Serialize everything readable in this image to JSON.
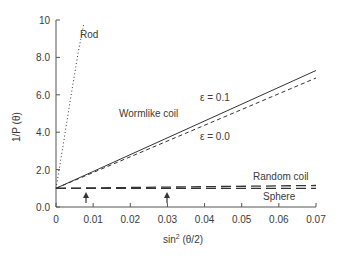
{
  "chart_data": {
    "type": "line",
    "title": "",
    "xlabel": "sin² (θ/2)",
    "ylabel": "1/P (θ)",
    "xlim": [
      0,
      0.07
    ],
    "ylim": [
      0,
      10
    ],
    "x_ticks": [
      "0",
      "0.01",
      "0.02",
      "0.03",
      "0.04",
      "0.05",
      "0.06",
      "0.07"
    ],
    "y_ticks": [
      "0.0",
      "2.0",
      "4.0",
      "6.0",
      "8.0",
      "10"
    ],
    "grid": false,
    "legend": "inline annotations",
    "series": [
      {
        "name": "Rod",
        "style": "dotted",
        "x": [
          0,
          0.002,
          0.004,
          0.006,
          0.0075
        ],
        "y": [
          1.0,
          3.4,
          5.9,
          8.3,
          9.8
        ]
      },
      {
        "name": "Wormlike coil ε = 0.1",
        "style": "solid",
        "x": [
          0,
          0.07
        ],
        "y": [
          1.0,
          7.3
        ]
      },
      {
        "name": "Wormlike coil ε = 0.0",
        "style": "dashed",
        "x": [
          0,
          0.07
        ],
        "y": [
          1.0,
          6.9
        ]
      },
      {
        "name": "Random coil",
        "style": "long-dashed",
        "x": [
          0,
          0.07
        ],
        "y": [
          1.0,
          1.15
        ]
      },
      {
        "name": "Sphere",
        "style": "long-dashed",
        "x": [
          0,
          0.07
        ],
        "y": [
          1.0,
          1.0
        ]
      }
    ],
    "annotations": [
      {
        "text": "Rod",
        "x": 0.0085,
        "y": 9.6
      },
      {
        "text": "Wormlike coil",
        "x": 0.022,
        "y": 4.5
      },
      {
        "text": "ε = 0.1",
        "x": 0.044,
        "y": 5.9
      },
      {
        "text": "ε = 0.0",
        "x": 0.044,
        "y": 3.8
      },
      {
        "text": "Random coil",
        "x": 0.062,
        "y": 1.6
      },
      {
        "text": "Sphere",
        "x": 0.064,
        "y": 0.5
      },
      {
        "text": "↑ arrow",
        "x": 0.008,
        "y": 0.6
      },
      {
        "text": "↑ arrow",
        "x": 0.03,
        "y": 0.6
      }
    ]
  },
  "labels": {
    "rod": "Rod",
    "wormlike": "Wormlike coil",
    "eps1": "ε = 0.1",
    "eps0": "ε = 0.0",
    "random": "Random coil",
    "sphere": "Sphere",
    "xlabel_main": "sin",
    "xlabel_sup": "2",
    "xlabel_rest": " (θ/2)",
    "ylabel": "1/P (θ)"
  }
}
